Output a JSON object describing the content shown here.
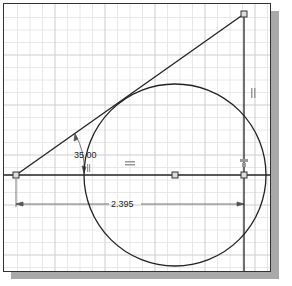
{
  "sketch": {
    "title": "2D sketch: triangle with tangent circle",
    "dimensions": {
      "angle": {
        "label": "35.00",
        "unit": "deg"
      },
      "linear": {
        "label": "2.395"
      }
    },
    "constraints": [
      {
        "name": "horizontal-constraint",
        "glyph": "═"
      },
      {
        "name": "vertical-constraint",
        "glyph": "‖"
      },
      {
        "name": "coincident-constraint",
        "glyph": "⊥"
      },
      {
        "name": "tangent-constraint",
        "glyph": "∥"
      }
    ],
    "colors": {
      "grid_minor": "#e6e6e6",
      "grid_major": "#c8c8c8",
      "geometry": "#222222",
      "dimension": "#555555",
      "shadow": "#a9a9a9"
    }
  }
}
